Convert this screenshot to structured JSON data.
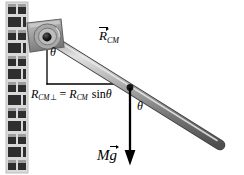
{
  "figure": {
    "type": "physics-free-body-diagram",
    "background_color": "#ffffff"
  },
  "wall": {
    "name": "brick-wall",
    "color_light": "#b8b8b8",
    "color_dark": "#2b2b2b",
    "mortar_color": "#d8d8d8",
    "x": 6,
    "y": 2,
    "width": 22,
    "height": 171,
    "rows": 12,
    "bricks_per_row": 2
  },
  "bracket": {
    "name": "wall-mount-bracket",
    "fill": "#9a9a9a",
    "stroke": "#5d5d5d",
    "highlight": "#c9c9c9"
  },
  "pivot": {
    "name": "pivot-hinge",
    "cx": 47,
    "cy": 37,
    "outer_radius": 13,
    "mid_radius": 8,
    "hub_radius": 4.4,
    "hub_color": "#111111",
    "ring_color": "#808080"
  },
  "rod": {
    "name": "rod",
    "start_x": 47,
    "start_y": 37,
    "end_x": 222,
    "end_y": 146,
    "thickness": 9,
    "fill_light": "#d4d4d4",
    "fill_mid": "#8d8d8d",
    "fill_dark": "#5c5c5c",
    "angle_deg": 32
  },
  "center_of_mass": {
    "name": "center-of-mass-point",
    "x": 130,
    "y": 88,
    "radius": 3.2,
    "color": "#1a1a1a"
  },
  "construction_lines": {
    "vertical_from_pivot": {
      "x": 47,
      "y1": 40,
      "y2": 84,
      "color": "#000000"
    },
    "horizontal_to_cm": {
      "y": 84,
      "x1": 47,
      "x2": 131,
      "color": "#000000"
    }
  },
  "force_vector": {
    "name": "weight-vector-arrow",
    "x": 130,
    "y_start": 88,
    "y_end": 165,
    "color": "#000000",
    "stroke_width": 2.2,
    "arrow_head_width": 9,
    "arrow_head_length": 13
  },
  "labels": {
    "rcm_vector": {
      "name": "R_CM vector label",
      "main": "R",
      "subscript": "CM",
      "has_vector_arrow": true,
      "text_plain": "R⃗_CM"
    },
    "theta_pivot": {
      "name": "theta at pivot",
      "text": "θ"
    },
    "theta_rod": {
      "name": "theta between rod and vertical",
      "text": "θ"
    },
    "rcm_perp_equation": {
      "name": "perpendicular lever arm equation",
      "lhs_main": "R",
      "lhs_sub": "CM",
      "lhs_perp": "⊥",
      "equals": "=",
      "rhs_main": "R",
      "rhs_sub": "CM",
      "rhs_func": "sin",
      "rhs_angle": "θ",
      "text_plain": "R_CM⊥ = R_CM sin θ"
    },
    "mg": {
      "name": "weight force label",
      "main": "M",
      "vector_symbol": "g",
      "has_vector_arrow": true,
      "text_plain": "Mg⃗"
    }
  }
}
